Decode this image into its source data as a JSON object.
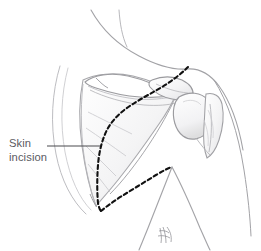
{
  "figure": {
    "type": "medical-illustration",
    "view": "posterior shoulder",
    "background_color": "#ffffff",
    "width": 261,
    "height": 251
  },
  "annotation": {
    "label_line1": "Skin",
    "label_line2": "incision",
    "label_color": "#5b5b5f",
    "leader_line_color": "#4a4a4e"
  },
  "incision": {
    "name": "skin-incision-path",
    "style": "dashed",
    "color": "#111111",
    "dash_pattern": "4 3",
    "stroke_width": 2.1
  },
  "anatomy": {
    "outline_color": "#9a9a9e",
    "bone_color": "#b4b4b8",
    "shade_color": "#d7d7da",
    "parts": [
      "neck-contour",
      "trapezius-contour",
      "scapula",
      "scapular-spine",
      "acromion",
      "humeral-head",
      "proximal-humerus",
      "deltoid-contour",
      "torso-contour",
      "axillary-fold"
    ]
  },
  "signature": {
    "text": "ℳ"
  }
}
